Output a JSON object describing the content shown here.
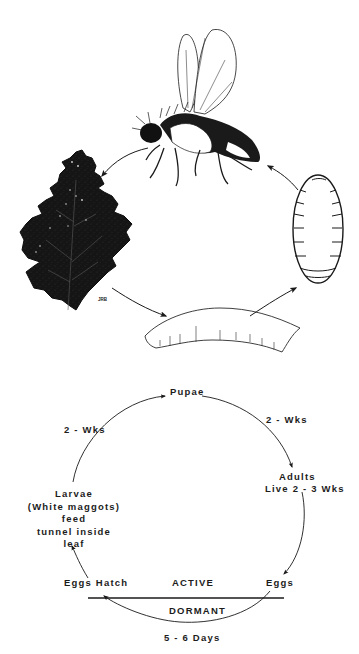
{
  "illustration": {
    "stages": [
      {
        "id": "adult",
        "name": "Adult fly"
      },
      {
        "id": "leaf",
        "name": "Mined leaf"
      },
      {
        "id": "larva",
        "name": "Larva (maggot)"
      },
      {
        "id": "pupa",
        "name": "Pupa"
      }
    ],
    "signature": "JRB"
  },
  "cycle": {
    "pupae": "Pupae",
    "pupae_to_adults": "2 - Wks",
    "adults": "Adults",
    "adults_life": "Live 2 - 3 Wks",
    "eggs": "Eggs",
    "active": "ACTIVE",
    "dormant": "DORMANT",
    "dormant_duration": "5 - 6 Days",
    "eggs_hatch": "Eggs Hatch",
    "larvae_lines": [
      "Larvae",
      "(White maggots)",
      "feed",
      "tunnel inside",
      "leaf"
    ],
    "larvae_to_pupae": "2 - Wks"
  },
  "colors": {
    "ink": "#1a1a1a",
    "background": "#ffffff"
  }
}
